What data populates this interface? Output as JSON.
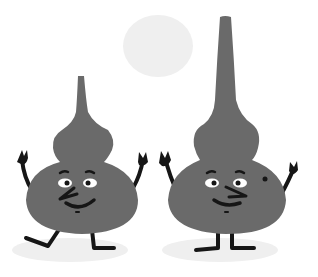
{
  "illustration": {
    "description": "Two gourd-shaped cartoon characters waving peace signs under a pale sun",
    "colors": {
      "background": "#ffffff",
      "body": "#6a6a6a",
      "limbs": "#161616",
      "sun": "#efefef",
      "shadow": "#efefef",
      "eye_white": "#ffffff"
    },
    "characters": [
      {
        "name": "short-gourd",
        "pose": "kicking one leg, both hands making peace signs"
      },
      {
        "name": "tall-gourd",
        "pose": "standing, both hands making peace signs, beauty mark on cheek"
      }
    ]
  }
}
